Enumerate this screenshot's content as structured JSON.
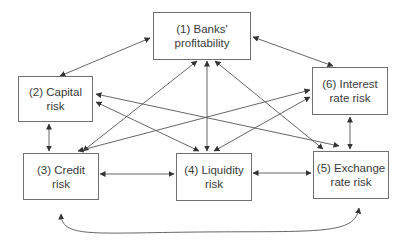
{
  "diagram": {
    "type": "network",
    "nodes": [
      {
        "id": 1,
        "line1": "(1) Banks'",
        "line2": "profitability"
      },
      {
        "id": 2,
        "line1": "(2) Capital",
        "line2": "risk"
      },
      {
        "id": 3,
        "line1": "(3) Credit",
        "line2": "risk"
      },
      {
        "id": 4,
        "line1": "(4) Liquidity",
        "line2": "risk"
      },
      {
        "id": 5,
        "line1": "(5) Exchange",
        "line2": "rate risk"
      },
      {
        "id": 6,
        "line1": "(6) Interest",
        "line2": "rate risk"
      }
    ],
    "edges": [
      {
        "from": 1,
        "to": 2,
        "direction": "both"
      },
      {
        "from": 1,
        "to": 6,
        "direction": "both"
      },
      {
        "from": 1,
        "to": 3,
        "direction": "both"
      },
      {
        "from": 1,
        "to": 4,
        "direction": "both"
      },
      {
        "from": 1,
        "to": 5,
        "direction": "both"
      },
      {
        "from": 2,
        "to": 3,
        "direction": "both"
      },
      {
        "from": 2,
        "to": 5,
        "direction": "both"
      },
      {
        "from": 2,
        "to": 6,
        "direction": "both"
      },
      {
        "from": 3,
        "to": 4,
        "direction": "both"
      },
      {
        "from": 3,
        "to": 6,
        "direction": "both"
      },
      {
        "from": 4,
        "to": 5,
        "direction": "both"
      },
      {
        "from": 4,
        "to": 6,
        "direction": "both"
      },
      {
        "from": 6,
        "to": 5,
        "direction": "both"
      },
      {
        "from": 3,
        "to": 5,
        "direction": "both",
        "style": "curved"
      }
    ],
    "colors": {
      "line": "#555555",
      "border": "#6f6f6f",
      "text": "#3a3a3a"
    }
  }
}
